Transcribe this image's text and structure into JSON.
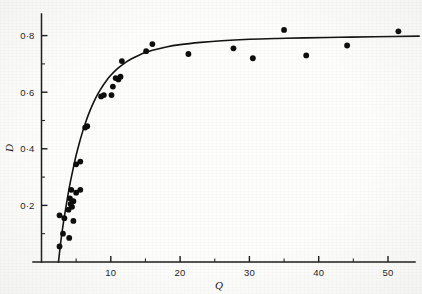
{
  "chart_data": {
    "type": "scatter",
    "title": "",
    "subtitle": "",
    "xlabel": "Q",
    "ylabel": "D",
    "xlim": [
      0,
      55
    ],
    "ylim": [
      0,
      0.88
    ],
    "grid": false,
    "legend": false,
    "legend_position": "none",
    "x_ticks_major": [
      10,
      20,
      30,
      40,
      50
    ],
    "x_tick_labels": [
      "10",
      "20",
      "30",
      "40",
      "50"
    ],
    "x_ticks_minor": [
      5,
      15,
      25,
      35,
      45
    ],
    "y_ticks_major": [
      0.2,
      0.4,
      0.6,
      0.8
    ],
    "y_tick_labels": [
      "0·2",
      "0·4",
      "0·6",
      "0·8"
    ],
    "y_ticks_minor": [
      0.1,
      0.3,
      0.5,
      0.7
    ],
    "marker": "filled-circle",
    "marker_color": "#0d0d0d",
    "curve_color": "#131313",
    "points": [
      {
        "x": 2.6,
        "y": 0.055
      },
      {
        "x": 3.1,
        "y": 0.1
      },
      {
        "x": 4.0,
        "y": 0.085
      },
      {
        "x": 3.3,
        "y": 0.155
      },
      {
        "x": 2.6,
        "y": 0.165
      },
      {
        "x": 4.6,
        "y": 0.145
      },
      {
        "x": 3.9,
        "y": 0.185
      },
      {
        "x": 4.4,
        "y": 0.195
      },
      {
        "x": 4.2,
        "y": 0.205
      },
      {
        "x": 4.6,
        "y": 0.215
      },
      {
        "x": 4.1,
        "y": 0.225
      },
      {
        "x": 5.0,
        "y": 0.245
      },
      {
        "x": 4.3,
        "y": 0.255
      },
      {
        "x": 5.6,
        "y": 0.255
      },
      {
        "x": 5.0,
        "y": 0.345
      },
      {
        "x": 5.6,
        "y": 0.355
      },
      {
        "x": 6.3,
        "y": 0.475
      },
      {
        "x": 6.6,
        "y": 0.48
      },
      {
        "x": 8.6,
        "y": 0.585
      },
      {
        "x": 9.0,
        "y": 0.59
      },
      {
        "x": 10.1,
        "y": 0.59
      },
      {
        "x": 10.3,
        "y": 0.62
      },
      {
        "x": 10.7,
        "y": 0.65
      },
      {
        "x": 11.1,
        "y": 0.645
      },
      {
        "x": 11.4,
        "y": 0.655
      },
      {
        "x": 11.6,
        "y": 0.71
      },
      {
        "x": 15.1,
        "y": 0.745
      },
      {
        "x": 16.0,
        "y": 0.77
      },
      {
        "x": 21.2,
        "y": 0.735
      },
      {
        "x": 27.7,
        "y": 0.755
      },
      {
        "x": 30.5,
        "y": 0.72
      },
      {
        "x": 35.0,
        "y": 0.82
      },
      {
        "x": 38.2,
        "y": 0.73
      },
      {
        "x": 44.1,
        "y": 0.765
      },
      {
        "x": 51.5,
        "y": 0.815
      }
    ],
    "fit_curve": {
      "description": "saturating hyperbolic fit",
      "x": [
        2.45,
        2.8,
        3.2,
        3.6,
        4.0,
        4.5,
        5.0,
        5.5,
        6.0,
        6.5,
        7.0,
        7.5,
        8.0,
        8.5,
        9.0,
        9.5,
        10.0,
        11.0,
        12.0,
        13.0,
        14.0,
        15.0,
        16.0,
        18.0,
        20.0,
        23.0,
        26.0,
        30.0,
        34.0,
        38.0,
        43.0,
        48.0,
        54.5
      ],
      "y": [
        0.0,
        0.075,
        0.145,
        0.205,
        0.262,
        0.322,
        0.377,
        0.424,
        0.466,
        0.503,
        0.535,
        0.563,
        0.588,
        0.609,
        0.628,
        0.645,
        0.66,
        0.684,
        0.703,
        0.718,
        0.73,
        0.74,
        0.748,
        0.76,
        0.768,
        0.776,
        0.782,
        0.787,
        0.79,
        0.792,
        0.794,
        0.796,
        0.798
      ]
    }
  },
  "axes": {
    "x_axis_name": "Q",
    "y_axis_name": "D"
  }
}
